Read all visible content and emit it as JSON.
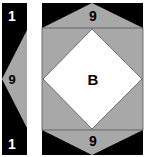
{
  "colors": {
    "black": "#000000",
    "gray": "#a8a8a8",
    "white": "#ffffff",
    "outline": "#555555"
  },
  "left_panel": {
    "top_label": "1",
    "middle_label": "9",
    "bottom_label": "1"
  },
  "right_panel": {
    "top_label": "9",
    "center_label": "B",
    "bottom_label": "9"
  }
}
